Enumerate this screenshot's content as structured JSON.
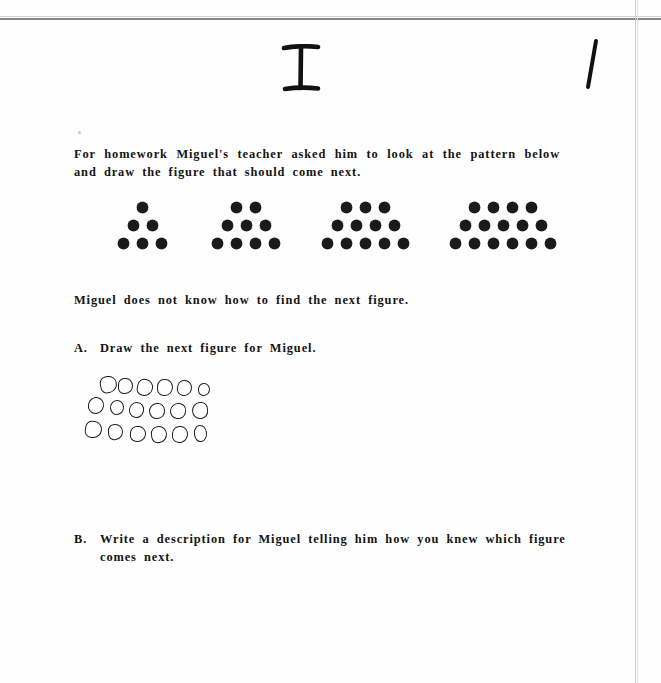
{
  "document": {
    "type": "scanned-worksheet",
    "page_marks": {
      "top_center_numeral": "I",
      "top_right_tally": "1"
    }
  },
  "content": {
    "intro_paragraph": "For homework Miguel's teacher asked him to look at the pattern below and draw the figure that should come next.",
    "statement": "Miguel does not know how to find the next figure.",
    "item_a": {
      "letter": "A.",
      "text": "Draw the next figure for Miguel."
    },
    "item_b": {
      "letter": "B.",
      "text": "Write a description for Miguel telling him how you knew which figure comes next."
    }
  },
  "chart_data": {
    "type": "table",
    "xlabel": "Figure number",
    "ylabel": "Number of dots",
    "categories": [
      "Figure 1",
      "Figure 2",
      "Figure 3",
      "Figure 4"
    ],
    "values": [
      6,
      9,
      12,
      15
    ],
    "annotations": [
      "Each figure adds 3 dots",
      "Rows grow by one dot each step"
    ],
    "figures": [
      {
        "name": "Figure 1",
        "rows": [
          1,
          2,
          3
        ],
        "total": 6,
        "left": 118
      },
      {
        "name": "Figure 2",
        "rows": [
          2,
          3,
          4
        ],
        "total": 9,
        "left": 212
      },
      {
        "name": "Figure 3",
        "rows": [
          3,
          4,
          5
        ],
        "total": 12,
        "left": 322
      },
      {
        "name": "Figure 4",
        "rows": [
          4,
          5,
          6
        ],
        "total": 15,
        "left": 450
      }
    ],
    "student_answer": {
      "name": "Student drawn figure 5",
      "rows": [
        6,
        6,
        6
      ],
      "total": 18,
      "style": "hand-drawn open circles",
      "circles": [
        {
          "x": 12,
          "y": 2,
          "w": 15,
          "h": 15
        },
        {
          "x": 30,
          "y": 4,
          "w": 13,
          "h": 14
        },
        {
          "x": 49,
          "y": 5,
          "w": 14,
          "h": 15
        },
        {
          "x": 69,
          "y": 5,
          "w": 14,
          "h": 15
        },
        {
          "x": 89,
          "y": 6,
          "w": 13,
          "h": 14
        },
        {
          "x": 110,
          "y": 9,
          "w": 10,
          "h": 11
        },
        {
          "x": 0,
          "y": 23,
          "w": 14,
          "h": 15
        },
        {
          "x": 22,
          "y": 26,
          "w": 12,
          "h": 13
        },
        {
          "x": 41,
          "y": 28,
          "w": 13,
          "h": 14
        },
        {
          "x": 61,
          "y": 29,
          "w": 14,
          "h": 14
        },
        {
          "x": 82,
          "y": 29,
          "w": 14,
          "h": 14
        },
        {
          "x": 104,
          "y": 28,
          "w": 14,
          "h": 15
        },
        {
          "x": -3,
          "y": 47,
          "w": 15,
          "h": 15
        },
        {
          "x": 20,
          "y": 50,
          "w": 13,
          "h": 14
        },
        {
          "x": 42,
          "y": 52,
          "w": 14,
          "h": 14
        },
        {
          "x": 63,
          "y": 52,
          "w": 14,
          "h": 15
        },
        {
          "x": 84,
          "y": 52,
          "w": 14,
          "h": 15
        },
        {
          "x": 106,
          "y": 51,
          "w": 11,
          "h": 15
        }
      ]
    }
  },
  "colors": {
    "ink": "#141414",
    "dot": "#1a1a1a",
    "pencil": "#1f1f1f",
    "scan_line": "#6e6e6e",
    "paper": "#fefefe"
  }
}
